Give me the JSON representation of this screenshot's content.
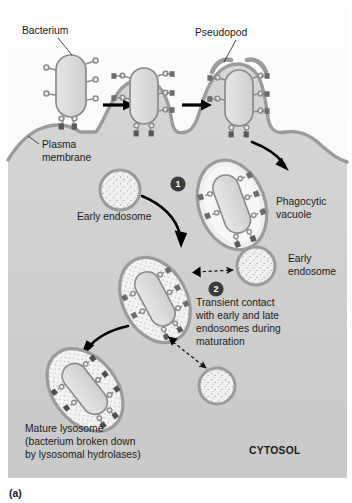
{
  "figure": {
    "caption": "(a)",
    "panel_bg_top": "#fbfbfb",
    "panel_bg_cytosol": "#d2d2d2",
    "membrane_color": "#9b9b9b",
    "organelle_fill": "#ededed",
    "bacterium_fill": "#dcdcdc",
    "receptor_color": "#8c8c8c",
    "accent_dark": "#3c3c3c"
  },
  "labels": {
    "bacterium": "Bacterium",
    "pseudopod": "Pseudopod",
    "plasma_membrane_line1": "Plasma",
    "plasma_membrane_line2": "membrane",
    "phagocytic_vacuole_line1": "Phagocytic",
    "phagocytic_vacuole_line2": "vacuole",
    "early_endosome_left": "Early endosome",
    "early_endosome_right_line1": "Early",
    "early_endosome_right_line2": "endosome",
    "transient_line1": "Transient contact",
    "transient_line2": "with early and late",
    "transient_line3": "endosomes during",
    "transient_line4": "maturation",
    "mature_lysosome_line1": "Mature lysosome",
    "mature_lysosome_line2": "(bacterium broken down",
    "mature_lysosome_line3": "by lysosomal hydrolases)",
    "cytosol": "CYTOSOL"
  },
  "steps": [
    {
      "number": "1",
      "meaning": "fusion-with-early-endosome"
    },
    {
      "number": "2",
      "meaning": "transient-contact-maturation"
    }
  ],
  "icons": {
    "solid_arrow": "arrow-right-icon",
    "curved_arrow": "curved-arrow-icon",
    "dashed_double_arrow": "dashed-double-arrow-icon",
    "leader_line": "leader-line-icon"
  }
}
